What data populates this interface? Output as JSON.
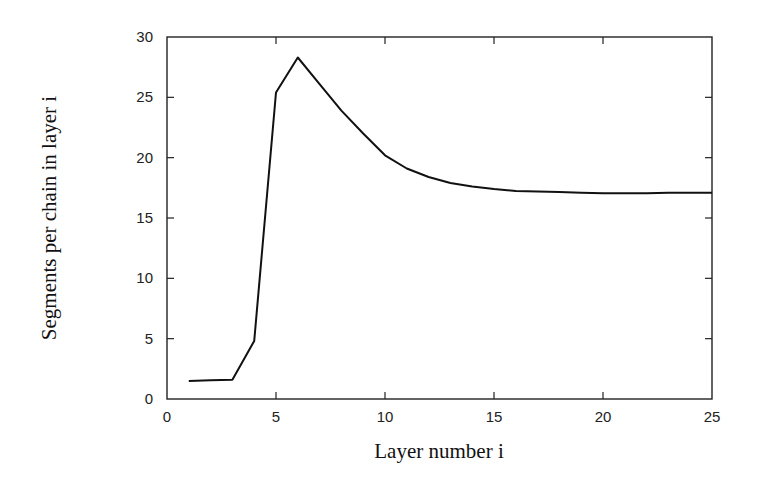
{
  "chart_data": {
    "type": "line",
    "title": "",
    "xlabel": "Layer number i",
    "ylabel": "Segments per chain in layer i",
    "xlim": [
      0,
      25
    ],
    "ylim": [
      0,
      30
    ],
    "xticks": [
      0,
      5,
      10,
      15,
      20,
      25
    ],
    "yticks": [
      0,
      5,
      10,
      15,
      20,
      25,
      30
    ],
    "grid": false,
    "legend": null,
    "series": [
      {
        "name": "Segments per chain",
        "color": "#111111",
        "x": [
          1,
          2,
          3,
          4,
          5,
          6,
          7,
          8,
          9,
          10,
          11,
          12,
          13,
          14,
          15,
          16,
          17,
          18,
          19,
          20,
          21,
          22,
          23,
          24,
          25
        ],
        "y": [
          1.5,
          1.55,
          1.6,
          4.8,
          25.4,
          28.3,
          26.1,
          23.9,
          22.0,
          20.2,
          19.1,
          18.4,
          17.9,
          17.6,
          17.4,
          17.25,
          17.2,
          17.15,
          17.1,
          17.05,
          17.05,
          17.05,
          17.1,
          17.1,
          17.1
        ]
      }
    ]
  }
}
